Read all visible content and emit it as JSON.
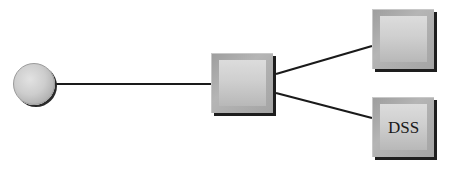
{
  "diagram": {
    "type": "network-topology",
    "nodes": [
      {
        "id": "start",
        "shape": "circle",
        "label": ""
      },
      {
        "id": "center",
        "shape": "box",
        "label": ""
      },
      {
        "id": "top_right",
        "shape": "box",
        "label": ""
      },
      {
        "id": "bottom_right",
        "shape": "box",
        "label": "DSS"
      }
    ],
    "edges": [
      {
        "from": "start",
        "to": "center"
      },
      {
        "from": "center",
        "to": "top_right"
      },
      {
        "from": "center",
        "to": "bottom_right"
      }
    ],
    "colors": {
      "background": "#ffffff",
      "line": "#1a1a1a",
      "node_fill": "#cfcfcf",
      "node_shadow": "#1e1e1e"
    }
  }
}
